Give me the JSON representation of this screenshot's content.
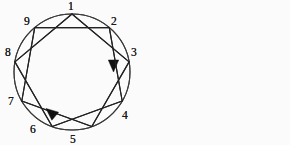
{
  "figure": {
    "background_color": "#fbfbfb",
    "line_color": "#222222",
    "circle_color": "#3a3a3a",
    "label_color": "#1a1a1a",
    "arrow_color": "#111111",
    "width": 290,
    "height": 145,
    "panel_count": 2
  },
  "chart_data": {
    "type": "diagram",
    "node_count": 9,
    "node_labels": [
      "1",
      "2",
      "3",
      "4",
      "5",
      "6",
      "7",
      "8",
      "9"
    ],
    "circle": {
      "cx": 72,
      "cy": 72,
      "r": 58
    },
    "nodes": [
      {
        "label": "1",
        "angle_deg": -90,
        "x": 72.0,
        "y": 14.0,
        "label_x": 68,
        "label_y": 10
      },
      {
        "label": "2",
        "angle_deg": -50,
        "x": 109.3,
        "y": 27.6,
        "label_x": 111,
        "label_y": 25
      },
      {
        "label": "3",
        "angle_deg": -10,
        "x": 129.1,
        "y": 61.9,
        "label_x": 131,
        "label_y": 56
      },
      {
        "label": "4",
        "angle_deg": 30,
        "x": 122.2,
        "y": 101.0,
        "label_x": 122,
        "label_y": 119
      },
      {
        "label": "5",
        "angle_deg": 70,
        "x": 91.8,
        "y": 126.5,
        "label_x": 70,
        "label_y": 143
      },
      {
        "label": "6",
        "angle_deg": 110,
        "x": 52.2,
        "y": 126.5,
        "label_x": 30,
        "label_y": 133
      },
      {
        "label": "7",
        "angle_deg": 150,
        "x": 21.8,
        "y": 101.0,
        "label_x": 8,
        "label_y": 105
      },
      {
        "label": "8",
        "angle_deg": 190,
        "x": 14.9,
        "y": 61.9,
        "label_x": 5,
        "label_y": 56
      },
      {
        "label": "9",
        "angle_deg": 230,
        "x": 34.7,
        "y": 27.6,
        "label_x": 24,
        "label_y": 25
      }
    ],
    "edges": [
      {
        "from": "1",
        "to": "3"
      },
      {
        "from": "3",
        "to": "5"
      },
      {
        "from": "5",
        "to": "7"
      },
      {
        "from": "7",
        "to": "9"
      },
      {
        "from": "9",
        "to": "2"
      },
      {
        "from": "2",
        "to": "4"
      },
      {
        "from": "4",
        "to": "6"
      },
      {
        "from": "6",
        "to": "8"
      },
      {
        "from": "8",
        "to": "1"
      }
    ],
    "panels": [
      {
        "id": "left",
        "name": "left-diagram",
        "arrow_on_edge": {
          "from": "2",
          "to": "4"
        },
        "arrow_direction": "down",
        "arrow_tip": {
          "x": 113.5,
          "y": 72.0
        },
        "arrow_angle_deg": 90
      },
      {
        "id": "right",
        "name": "right-diagram",
        "arrow_on_edge": {
          "from": "5",
          "to": "7"
        },
        "arrow_direction": "up-left",
        "arrow_tip": {
          "x": 46.0,
          "y": 108.5
        },
        "arrow_angle_deg": 220
      }
    ]
  }
}
